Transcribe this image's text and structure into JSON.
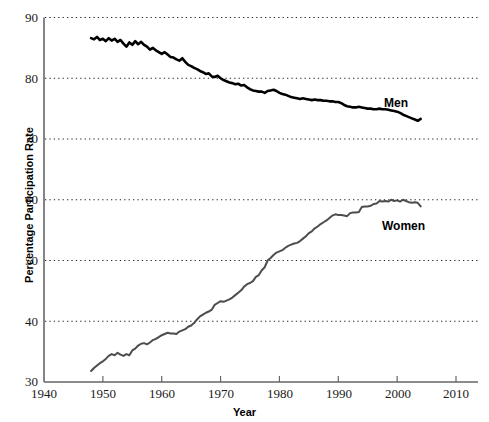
{
  "chart_data": {
    "type": "line",
    "title": "",
    "xlabel": "Year",
    "ylabel": "Percentage Participation Rate",
    "xlim": [
      1940,
      2012
    ],
    "ylim": [
      30,
      90
    ],
    "xticks": [
      1940,
      1950,
      1960,
      1970,
      1980,
      1990,
      2000,
      2010
    ],
    "yticks": [
      30,
      40,
      50,
      60,
      70,
      80,
      90
    ],
    "grid": "horizontal-dotted",
    "legend": "inline-annotations",
    "series": [
      {
        "name": "Men",
        "color": "#000000",
        "width": 2.6,
        "label_x": 2000,
        "label_y": 76.5,
        "x": [
          1948.0,
          1948.5,
          1949.0,
          1949.5,
          1950.0,
          1950.5,
          1951.0,
          1951.5,
          1952.0,
          1952.5,
          1953.0,
          1953.5,
          1954.0,
          1954.5,
          1955.0,
          1955.5,
          1956.0,
          1956.5,
          1957.0,
          1957.5,
          1958.0,
          1958.5,
          1959.0,
          1959.5,
          1960.0,
          1960.5,
          1961.0,
          1961.5,
          1962.0,
          1962.5,
          1963.0,
          1963.5,
          1964.0,
          1964.5,
          1965.0,
          1965.5,
          1966.0,
          1966.5,
          1967.0,
          1967.5,
          1968.0,
          1968.5,
          1969.0,
          1969.5,
          1970.0,
          1970.5,
          1971.0,
          1971.5,
          1972.0,
          1972.5,
          1973.0,
          1973.5,
          1974.0,
          1974.5,
          1975.0,
          1975.5,
          1976.0,
          1976.5,
          1977.0,
          1977.5,
          1978.0,
          1978.5,
          1979.0,
          1979.5,
          1980.0,
          1980.5,
          1981.0,
          1981.5,
          1982.0,
          1982.5,
          1983.0,
          1983.5,
          1984.0,
          1984.5,
          1985.0,
          1985.5,
          1986.0,
          1986.5,
          1987.0,
          1987.5,
          1988.0,
          1988.5,
          1989.0,
          1989.5,
          1990.0,
          1990.5,
          1991.0,
          1991.5,
          1992.0,
          1992.5,
          1993.0,
          1993.5,
          1994.0,
          1994.5,
          1995.0,
          1995.5,
          1996.0,
          1996.5,
          1997.0,
          1997.5,
          1998.0,
          1998.5,
          1999.0,
          1999.5,
          2000.0,
          2000.5,
          2001.0,
          2001.5,
          2002.0,
          2002.5,
          2003.0,
          2003.5,
          2004.0
        ],
        "y": [
          86.6,
          86.4,
          86.8,
          86.3,
          86.5,
          86.1,
          86.6,
          86.2,
          86.5,
          86.0,
          86.3,
          85.7,
          85.2,
          85.9,
          85.5,
          86.1,
          85.6,
          86.0,
          85.5,
          85.2,
          84.7,
          85.0,
          84.6,
          84.3,
          84.0,
          84.3,
          83.9,
          83.5,
          83.4,
          83.1,
          82.9,
          83.3,
          82.7,
          82.2,
          82.0,
          81.7,
          81.5,
          81.2,
          81.0,
          80.7,
          80.8,
          80.3,
          80.2,
          80.4,
          80.0,
          79.7,
          79.5,
          79.3,
          79.2,
          79.0,
          79.1,
          78.8,
          78.9,
          78.5,
          78.2,
          78.0,
          77.9,
          77.8,
          77.8,
          77.6,
          77.9,
          78.0,
          78.1,
          77.9,
          77.6,
          77.4,
          77.3,
          77.1,
          76.9,
          76.8,
          76.7,
          76.6,
          76.7,
          76.6,
          76.5,
          76.4,
          76.5,
          76.4,
          76.4,
          76.3,
          76.3,
          76.2,
          76.2,
          76.1,
          76.1,
          75.9,
          75.6,
          75.4,
          75.3,
          75.2,
          75.2,
          75.3,
          75.2,
          75.1,
          75.0,
          75.0,
          74.9,
          74.9,
          75.0,
          74.9,
          74.9,
          74.8,
          74.7,
          74.6,
          74.5,
          74.3,
          74.0,
          73.8,
          73.6,
          73.4,
          73.2,
          73.0,
          73.3
        ]
      },
      {
        "name": "Women",
        "color": "#4d4d4d",
        "width": 2.0,
        "label_x": 1999,
        "label_y": 55.5,
        "x": [
          1948.0,
          1948.5,
          1949.0,
          1949.5,
          1950.0,
          1950.5,
          1951.0,
          1951.5,
          1952.0,
          1952.5,
          1953.0,
          1953.5,
          1954.0,
          1954.5,
          1955.0,
          1955.5,
          1956.0,
          1956.5,
          1957.0,
          1957.5,
          1958.0,
          1958.5,
          1959.0,
          1959.5,
          1960.0,
          1960.5,
          1961.0,
          1961.5,
          1962.0,
          1962.5,
          1963.0,
          1963.5,
          1964.0,
          1964.5,
          1965.0,
          1965.5,
          1966.0,
          1966.5,
          1967.0,
          1967.5,
          1968.0,
          1968.5,
          1969.0,
          1969.5,
          1970.0,
          1970.5,
          1971.0,
          1971.5,
          1972.0,
          1972.5,
          1973.0,
          1973.5,
          1974.0,
          1974.5,
          1975.0,
          1975.5,
          1976.0,
          1976.5,
          1977.0,
          1977.5,
          1978.0,
          1978.5,
          1979.0,
          1979.5,
          1980.0,
          1980.5,
          1981.0,
          1981.5,
          1982.0,
          1982.5,
          1983.0,
          1983.5,
          1984.0,
          1984.5,
          1985.0,
          1985.5,
          1986.0,
          1986.5,
          1987.0,
          1987.5,
          1988.0,
          1988.5,
          1989.0,
          1989.5,
          1990.0,
          1990.5,
          1991.0,
          1991.5,
          1992.0,
          1992.5,
          1993.0,
          1993.5,
          1994.0,
          1994.5,
          1995.0,
          1995.5,
          1996.0,
          1996.5,
          1997.0,
          1997.5,
          1998.0,
          1998.5,
          1999.0,
          1999.5,
          2000.0,
          2000.5,
          2001.0,
          2001.5,
          2002.0,
          2002.5,
          2003.0,
          2003.5,
          2004.0
        ],
        "y": [
          31.8,
          32.3,
          32.7,
          33.1,
          33.4,
          33.8,
          34.3,
          34.6,
          34.4,
          34.8,
          34.5,
          34.3,
          34.6,
          34.4,
          35.2,
          35.5,
          36.0,
          36.3,
          36.4,
          36.2,
          36.5,
          36.9,
          37.1,
          37.4,
          37.7,
          37.9,
          38.1,
          38.0,
          38.0,
          37.9,
          38.3,
          38.5,
          38.7,
          39.1,
          39.3,
          39.7,
          40.3,
          40.8,
          41.1,
          41.4,
          41.6,
          41.9,
          42.7,
          43.0,
          43.3,
          43.2,
          43.4,
          43.6,
          43.9,
          44.3,
          44.7,
          45.1,
          45.7,
          46.1,
          46.3,
          46.6,
          47.3,
          47.6,
          48.4,
          48.9,
          50.0,
          50.4,
          50.9,
          51.3,
          51.5,
          51.7,
          52.1,
          52.4,
          52.6,
          52.8,
          52.9,
          53.2,
          53.6,
          54.0,
          54.5,
          54.8,
          55.3,
          55.6,
          56.0,
          56.3,
          56.6,
          57.0,
          57.4,
          57.6,
          57.5,
          57.5,
          57.4,
          57.3,
          57.8,
          57.9,
          57.9,
          58.0,
          58.8,
          58.9,
          58.9,
          59.0,
          59.3,
          59.4,
          59.8,
          59.7,
          59.8,
          59.7,
          60.0,
          59.8,
          59.9,
          59.7,
          60.0,
          59.8,
          59.6,
          59.5,
          59.6,
          59.5,
          58.9
        ]
      }
    ]
  },
  "axes": {
    "xlabel": "Year",
    "ylabel": "Percentage Participation Rate",
    "xticks": [
      "1940",
      "1950",
      "1960",
      "1970",
      "1980",
      "1990",
      "2000",
      "2010"
    ],
    "yticks": [
      "90",
      "80",
      "70",
      "60",
      "50",
      "40",
      "30"
    ]
  },
  "annotations": {
    "men": "Men",
    "women": "Women"
  },
  "colors": {
    "men_line": "#000000",
    "women_line": "#4d4d4d",
    "axis": "#666666",
    "grid": "#222222",
    "background": "#ffffff"
  }
}
